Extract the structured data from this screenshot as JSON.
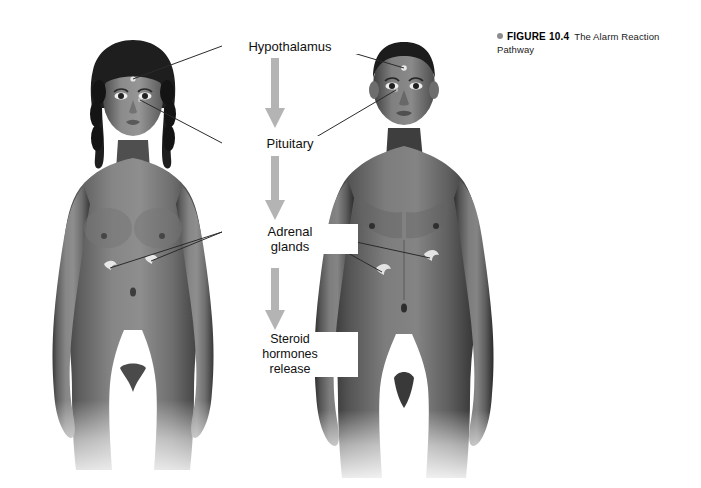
{
  "figure": {
    "caption_bullet": "bullet-dot",
    "caption_label": "FIGURE 10.4",
    "caption_text": "The Alarm Reaction Pathway"
  },
  "flow": {
    "steps": [
      {
        "id": "hypothalamus",
        "label": "Hypothalamus"
      },
      {
        "id": "pituitary",
        "label": "Pituitary"
      },
      {
        "id": "adrenal",
        "label": "Adrenal\nglands"
      },
      {
        "id": "steroid",
        "label": "Steroid\nhormones\nrelease"
      }
    ],
    "arrow_color": "#b4b4b4",
    "leader_line_color": "#2b2b2b"
  },
  "figures": [
    {
      "id": "female-figure",
      "name": "female-body-illustration",
      "side": "left"
    },
    {
      "id": "male-figure",
      "name": "male-body-illustration",
      "side": "right"
    }
  ],
  "anatomy_markers": {
    "hypothalamus": "hypothalamus-marker",
    "pituitary": "pituitary-marker",
    "adrenal_gland": "adrenal-gland-marker"
  },
  "colors": {
    "background": "#ffffff",
    "body_mid": "#6f6f6f",
    "body_dark": "#2e2e2e",
    "body_light": "#a8a8a8",
    "arrow_gray": "#b4b4b4",
    "text": "#101010",
    "bullet_gray": "#8d8d8d"
  }
}
